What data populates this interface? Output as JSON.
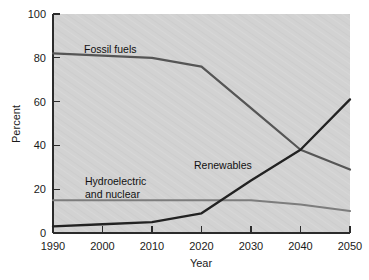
{
  "chart_data": {
    "type": "line",
    "title": "",
    "xlabel": "Year",
    "ylabel": "Percent",
    "xlim": [
      1990,
      2050
    ],
    "ylim": [
      0,
      100
    ],
    "grid": false,
    "legend_position": "inline-annotations",
    "x_ticks": [
      "1990",
      "2000",
      "2010",
      "2020",
      "2030",
      "2040",
      "2050"
    ],
    "y_ticks": [
      "0",
      "20",
      "40",
      "60",
      "80",
      "100"
    ],
    "x": [
      1990,
      2000,
      2010,
      2020,
      2030,
      2040,
      2050
    ],
    "series": [
      {
        "name": "Fossil fuels",
        "color": "#555555",
        "values": [
          82,
          81,
          80,
          76,
          57,
          38,
          29
        ]
      },
      {
        "name": "Renewables",
        "color": "#222222",
        "values": [
          3,
          4,
          5,
          9,
          24,
          38,
          61
        ]
      },
      {
        "name": "Hydroelectric and nuclear",
        "color": "#7d7d7d",
        "values": [
          15,
          15,
          15,
          15,
          15,
          13,
          10
        ]
      }
    ],
    "annotations": [
      {
        "text": "Fossil fuels",
        "x": 2004,
        "y": 89
      },
      {
        "text": "Renewables",
        "x": 2025,
        "y": 33
      },
      {
        "text": "Hydroelectric",
        "x": 2008,
        "y": 24
      },
      {
        "text": "and nuclear",
        "x": 2008,
        "y": 19
      }
    ]
  },
  "axes": {
    "y_title": "Percent",
    "x_title": "Year",
    "y_tick_labels": [
      "100",
      "80",
      "60",
      "40",
      "20",
      "0"
    ],
    "x_tick_labels": [
      "1990",
      "2000",
      "2010",
      "2020",
      "2030",
      "2040",
      "2050"
    ]
  },
  "labels": {
    "fossil_fuels": "Fossil fuels",
    "renewables": "Renewables",
    "hydro_line1": "Hydroelectric",
    "hydro_line2": "and nuclear"
  },
  "colors": {
    "plot_background": "#d2d2d2",
    "page_background": "#ffffff",
    "axis": "#2b2b2b",
    "fossil_fuels": "#555555",
    "renewables": "#222222",
    "hydro_nuclear": "#7d7d7d"
  }
}
